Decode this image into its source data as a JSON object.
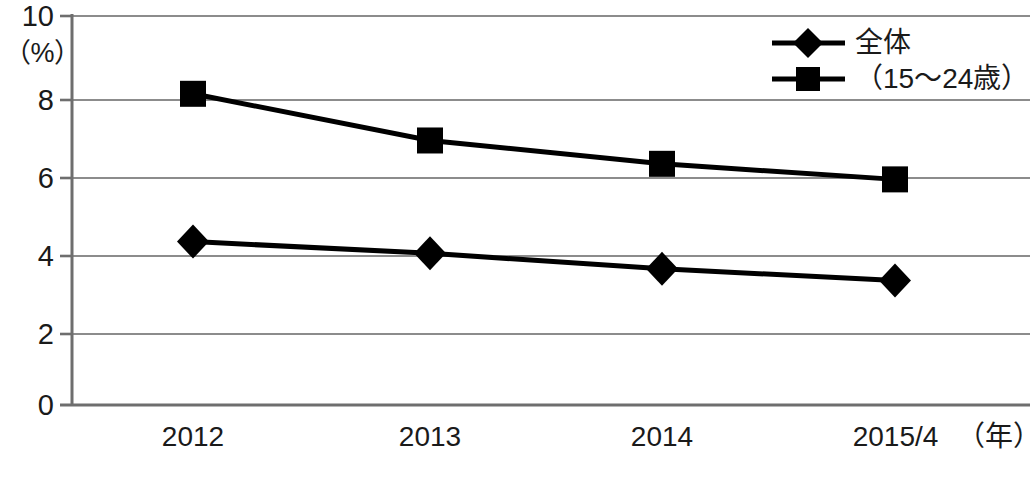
{
  "chart_data": {
    "type": "line",
    "title": "",
    "subtitle": "",
    "xlabel": "（年）",
    "ylabel": "（%）",
    "categories": [
      "2012",
      "2013",
      "2014",
      "2015/4"
    ],
    "x_tick_labels": [
      "2012",
      "2013",
      "2014",
      "2015/4"
    ],
    "y_tick_labels": [
      "0",
      "2",
      "4",
      "6",
      "8",
      "10"
    ],
    "y_ticks": [
      0,
      2,
      4,
      6,
      8,
      10
    ],
    "ylim": [
      0,
      10
    ],
    "grid": "horizontal",
    "legend_position": "top-right",
    "series": [
      {
        "name": "全体",
        "marker": "diamond",
        "color": "#000000",
        "values": [
          4.2,
          3.9,
          3.5,
          3.2
        ]
      },
      {
        "name": "（15〜24歳）",
        "marker": "square",
        "color": "#000000",
        "values": [
          8.0,
          6.8,
          6.2,
          5.8
        ]
      }
    ]
  },
  "legend": {
    "items": [
      {
        "label": "全体",
        "marker": "diamond"
      },
      {
        "label": "（15〜24歳）",
        "marker": "square"
      }
    ]
  },
  "axes": {
    "y_unit": "（%）",
    "x_unit": "（年）"
  },
  "colors": {
    "series": "#000000",
    "grid": "#8c8c8c",
    "axis": "#6e6e6e",
    "text": "#1a1a1a",
    "background": "#ffffff"
  }
}
